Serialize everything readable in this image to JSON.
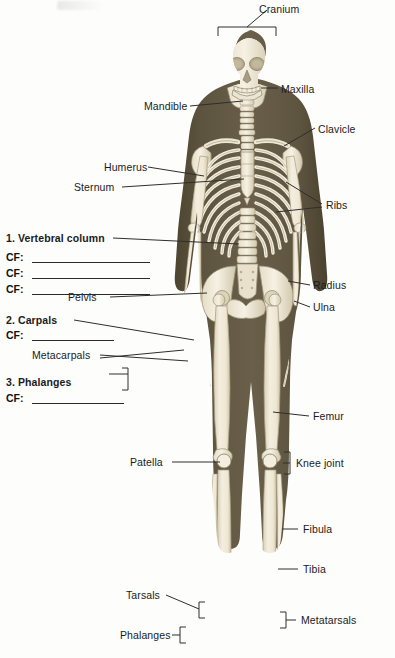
{
  "page": {
    "background_color": "#fdfdfb",
    "body_color": "#5a5040",
    "bone_color": "#f1ebda",
    "bone_shadow": "#cfc6ad",
    "line_color": "#2e2e2e",
    "text_color": "#1b1b1b"
  },
  "labels": {
    "cranium": "Cranium",
    "maxilla": "Maxilla",
    "mandible": "Mandible",
    "clavicle": "Clavicle",
    "humerus": "Humerus",
    "sternum": "Sternum",
    "ribs": "Ribs",
    "vertebral_column": "1. Vertebral column",
    "pelvis": "Pelvis",
    "radius": "Radius",
    "ulna": "Ulna",
    "carpals": "2. Carpals",
    "metacarpals": "Metacarpals",
    "phalanges_hand": "3. Phalanges",
    "femur": "Femur",
    "knee_joint": "Knee joint",
    "patella": "Patella",
    "fibula": "Fibula",
    "tibia": "Tibia",
    "tarsals": "Tarsals",
    "metatarsals": "Metatarsals",
    "phalanges_foot": "Phalanges"
  },
  "fill_in_blanks": {
    "prefix": "CF:",
    "items": [
      {
        "id": "cf-vertebral-1",
        "prefix": "CF:",
        "value": ""
      },
      {
        "id": "cf-vertebral-2",
        "prefix": "CF:",
        "value": ""
      },
      {
        "id": "cf-vertebral-3",
        "prefix": "CF:",
        "value": ""
      },
      {
        "id": "cf-carpals",
        "prefix": "CF:",
        "value": ""
      },
      {
        "id": "cf-phalanges",
        "prefix": "CF:",
        "value": ""
      }
    ]
  }
}
